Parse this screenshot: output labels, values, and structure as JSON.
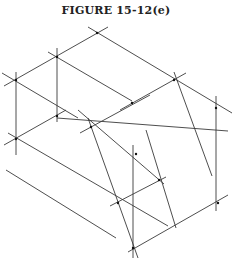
{
  "figure": {
    "title": "FIGURE 15-12(e)"
  },
  "diagram": {
    "type": "isometric construction sketch of a stepped block",
    "line_color": "#3a3a3a",
    "background": "#ffffff",
    "lines": [
      {
        "x1": 88,
        "y1": 27,
        "x2": 232,
        "y2": 113
      },
      {
        "x1": 4,
        "y1": 86,
        "x2": 108,
        "y2": 27
      },
      {
        "x1": 2,
        "y1": 73,
        "x2": 78,
        "y2": 118
      },
      {
        "x1": 48,
        "y1": 52,
        "x2": 132,
        "y2": 101
      },
      {
        "x1": 4,
        "y1": 145,
        "x2": 66,
        "y2": 110
      },
      {
        "x1": 8,
        "y1": 133,
        "x2": 168,
        "y2": 226
      },
      {
        "x1": 6,
        "y1": 170,
        "x2": 116,
        "y2": 238
      },
      {
        "x1": 78,
        "y1": 110,
        "x2": 164,
        "y2": 184
      },
      {
        "x1": 57,
        "y1": 118,
        "x2": 228,
        "y2": 131
      },
      {
        "x1": 120,
        "y1": 110,
        "x2": 186,
        "y2": 73
      },
      {
        "x1": 80,
        "y1": 133,
        "x2": 150,
        "y2": 95
      },
      {
        "x1": 110,
        "y1": 206,
        "x2": 166,
        "y2": 177
      },
      {
        "x1": 128,
        "y1": 252,
        "x2": 228,
        "y2": 195
      },
      {
        "x1": 16,
        "y1": 72,
        "x2": 16,
        "y2": 155
      },
      {
        "x1": 57,
        "y1": 48,
        "x2": 57,
        "y2": 122
      },
      {
        "x1": 133,
        "y1": 145,
        "x2": 133,
        "y2": 258
      },
      {
        "x1": 216,
        "y1": 96,
        "x2": 216,
        "y2": 211
      },
      {
        "x1": 174,
        "y1": 72,
        "x2": 212,
        "y2": 176
      },
      {
        "x1": 88,
        "y1": 118,
        "x2": 138,
        "y2": 258
      },
      {
        "x1": 146,
        "y1": 130,
        "x2": 176,
        "y2": 228
      }
    ],
    "points": [
      {
        "x": 97,
        "y": 33
      },
      {
        "x": 57,
        "y": 57
      },
      {
        "x": 16,
        "y": 80
      },
      {
        "x": 16,
        "y": 139
      },
      {
        "x": 57,
        "y": 116
      },
      {
        "x": 174,
        "y": 80
      },
      {
        "x": 216,
        "y": 108
      },
      {
        "x": 132,
        "y": 103
      },
      {
        "x": 91,
        "y": 127
      },
      {
        "x": 136,
        "y": 154
      },
      {
        "x": 159,
        "y": 180
      },
      {
        "x": 218,
        "y": 203
      },
      {
        "x": 118,
        "y": 203
      },
      {
        "x": 133,
        "y": 248
      }
    ]
  }
}
